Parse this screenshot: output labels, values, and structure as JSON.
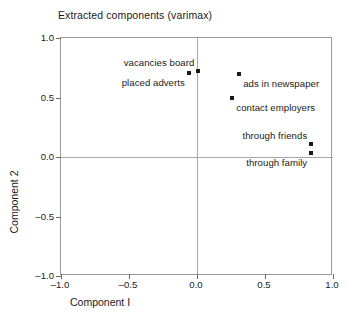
{
  "chart_data": {
    "type": "scatter",
    "title": "Extracted components (varimax)",
    "xlabel": "Component I",
    "ylabel": "Component 2",
    "xlim": [
      -1.0,
      1.0
    ],
    "ylim": [
      -1.0,
      1.0
    ],
    "grid": false,
    "legend": "none",
    "zero_reference_lines": true,
    "xticks": [
      "-1.0",
      "-0.5",
      "0.0",
      "0.5",
      "1.0"
    ],
    "xtick_values": [
      -1.0,
      -0.5,
      0.0,
      0.5,
      1.0
    ],
    "yticks": [
      "1.0",
      "0.5",
      "0.0",
      "-0.5",
      "-1.0"
    ],
    "ytick_values": [
      1.0,
      0.5,
      0.0,
      -0.5,
      -1.0
    ],
    "marker_color": "#1a1a1a",
    "marker_shape": "square",
    "points": [
      {
        "label": "vacancies board",
        "x": 0.01,
        "y": 0.72,
        "label_pos": "above-left"
      },
      {
        "label": "placed adverts",
        "x": -0.06,
        "y": 0.71,
        "label_pos": "below-left"
      },
      {
        "label": "ads in newspaper",
        "x": 0.31,
        "y": 0.7,
        "label_pos": "below-right"
      },
      {
        "label": "contact employers",
        "x": 0.26,
        "y": 0.5,
        "label_pos": "below-right"
      },
      {
        "label": "through friends",
        "x": 0.84,
        "y": 0.11,
        "label_pos": "above-left"
      },
      {
        "label": "through family",
        "x": 0.84,
        "y": 0.03,
        "label_pos": "below-left"
      }
    ]
  }
}
